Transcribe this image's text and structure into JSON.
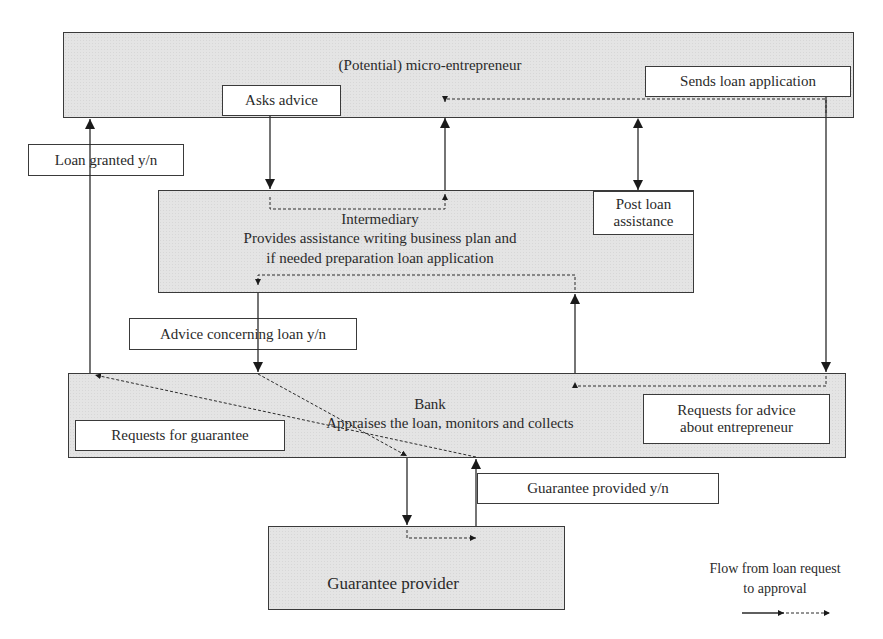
{
  "diagram": {
    "nodes": {
      "entrepreneur": {
        "label": "(Potential) micro-entrepreneur"
      },
      "intermediary": {
        "title": "Intermediary",
        "line1": "Provides assistance writing business plan and",
        "line2": "if needed preparation loan application"
      },
      "bank": {
        "title": "Bank",
        "description": "Appraises the loan, monitors and collects"
      },
      "guarantee_provider": {
        "label": "Guarantee provider"
      }
    },
    "edge_labels": {
      "asks_advice": "Asks advice",
      "sends_loan_application": "Sends loan application",
      "loan_granted": "Loan granted y/n",
      "post_loan_line1": "Post loan",
      "post_loan_line2": "assistance",
      "advice_concerning_loan": "Advice concerning loan y/n",
      "requests_for_guarantee": "Requests for guarantee",
      "requests_advice_line1": "Requests for advice",
      "requests_advice_line2": "about entrepreneur",
      "guarantee_provided": "Guarantee provided y/n"
    },
    "legend": {
      "line1": "Flow from loan request",
      "line2": "to approval"
    },
    "colors": {
      "box_fill": "#e4e4e4",
      "line": "#2a2a2a",
      "label_fill": "#ffffff"
    }
  }
}
